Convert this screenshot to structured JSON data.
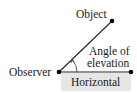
{
  "diagram": {
    "labels": {
      "object": "Object",
      "observer": "Observer",
      "angle_line1": "Angle of",
      "angle_line2": "elevation",
      "horizontal": "Horizontal"
    },
    "colors": {
      "line": "#222222",
      "point": "#000000",
      "horizontal_box": "#e6e6e6",
      "text": "#1a1a1a"
    }
  }
}
